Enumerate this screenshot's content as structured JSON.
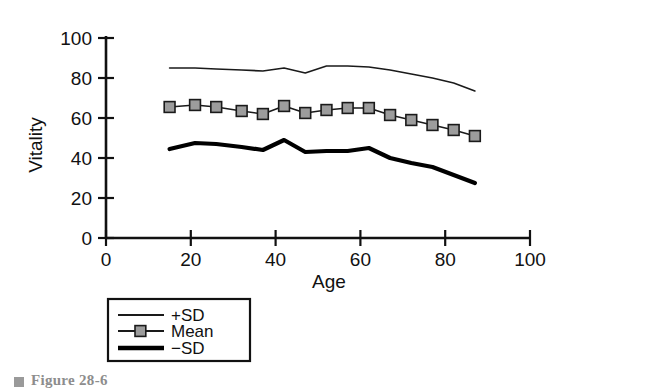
{
  "figure": {
    "caption_label": "Figure 28-6",
    "caption_marker_icon": "square-bullet-icon"
  },
  "chart_data": {
    "type": "line",
    "title": "",
    "xlabel": "Age",
    "ylabel": "Vitality",
    "xlim": [
      0,
      100
    ],
    "ylim": [
      0,
      100
    ],
    "xticks": [
      0,
      20,
      40,
      60,
      80,
      100
    ],
    "yticks": [
      0,
      20,
      40,
      60,
      80,
      100
    ],
    "xtick_labels": [
      "0",
      "20",
      "40",
      "60",
      "80",
      "100"
    ],
    "ytick_labels": [
      "0",
      "20",
      "40",
      "60",
      "80",
      "100"
    ],
    "grid": false,
    "legend_position": "below-left",
    "x": [
      15,
      21,
      26,
      32,
      37,
      42,
      47,
      52,
      57,
      62,
      67,
      72,
      77,
      82,
      87
    ],
    "series": [
      {
        "name": "+SD",
        "label": "+SD",
        "marker": "none",
        "line_width": 1.6,
        "color": "#1a1a1a",
        "values": [
          85,
          85,
          84.5,
          84,
          83.5,
          85,
          82.5,
          86,
          86,
          85.5,
          84,
          82,
          80,
          77.5,
          73.5
        ]
      },
      {
        "name": "Mean",
        "label": "Mean",
        "marker": "square",
        "marker_fill": "#9c9c9c",
        "marker_edge": "#1a1a1a",
        "line_width": 1.6,
        "color": "#1a1a1a",
        "values": [
          65.5,
          66.5,
          65.5,
          63.5,
          62,
          66,
          62.5,
          64,
          65,
          65,
          61.5,
          59,
          56.5,
          54,
          51
        ]
      },
      {
        "name": "−SD",
        "label": "−SD",
        "marker": "none",
        "line_width": 4.2,
        "color": "#000000",
        "values": [
          44.5,
          47.5,
          47,
          45.5,
          44,
          49,
          43,
          43.5,
          43.5,
          45,
          40,
          37.5,
          35.5,
          31.5,
          27.5
        ]
      }
    ]
  },
  "legend": {
    "entries": [
      {
        "label": "+SD",
        "style": "thin-line"
      },
      {
        "label": "Mean",
        "style": "line-with-square-marker"
      },
      {
        "label": "−SD",
        "style": "thick-line"
      }
    ]
  }
}
